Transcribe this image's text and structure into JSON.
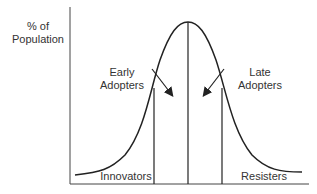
{
  "diagram": {
    "title": "",
    "y_axis_label": [
      "% of",
      "Population"
    ],
    "segments": [
      {
        "id": "innovators",
        "label": "Innovators"
      },
      {
        "id": "early-adopters",
        "label": [
          "Early",
          "Adopters"
        ]
      },
      {
        "id": "late-adopters",
        "label": [
          "Late",
          "Adopters"
        ]
      },
      {
        "id": "resisters",
        "label": "Resisters"
      }
    ],
    "colors": {
      "line": "#222222",
      "background": "#ffffff"
    }
  }
}
